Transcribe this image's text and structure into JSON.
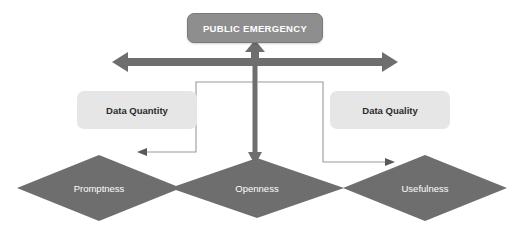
{
  "diagram": {
    "title_box": {
      "label": "PUBLIC EMERGENCY",
      "fill": "#8e8e8e",
      "text_color": "#ffffff"
    },
    "side_boxes": [
      {
        "id": "data-quantity",
        "label": "Data Quantity",
        "fill": "#e6e6e6",
        "text_color": "#2b2b2b"
      },
      {
        "id": "data-quality",
        "label": "Data Quality",
        "fill": "#e6e6e6",
        "text_color": "#2b2b2b"
      }
    ],
    "diamonds": [
      {
        "id": "promptness",
        "label": "Promptness",
        "fill": "#6e6e6e",
        "text_color": "#ffffff"
      },
      {
        "id": "openness",
        "label": "Openness",
        "fill": "#6e6e6e",
        "text_color": "#ffffff"
      },
      {
        "id": "usefulness",
        "label": "Usefulness",
        "fill": "#6e6e6e",
        "text_color": "#ffffff"
      }
    ],
    "connectors": [
      {
        "id": "horizontal-double-arrow",
        "style": "thick",
        "color": "#6e6e6e",
        "direction": "both"
      },
      {
        "id": "up-arrow-to-emergency",
        "style": "thick",
        "color": "#6e6e6e",
        "direction": "up"
      },
      {
        "id": "down-arrow-to-openness",
        "style": "thick",
        "color": "#6e6e6e",
        "direction": "down"
      },
      {
        "id": "elbow-to-promptness",
        "style": "thin",
        "color": "#9a9a9a",
        "direction": "left"
      },
      {
        "id": "elbow-to-usefulness",
        "style": "thin",
        "color": "#9a9a9a",
        "direction": "right"
      }
    ],
    "background": "#ffffff"
  }
}
